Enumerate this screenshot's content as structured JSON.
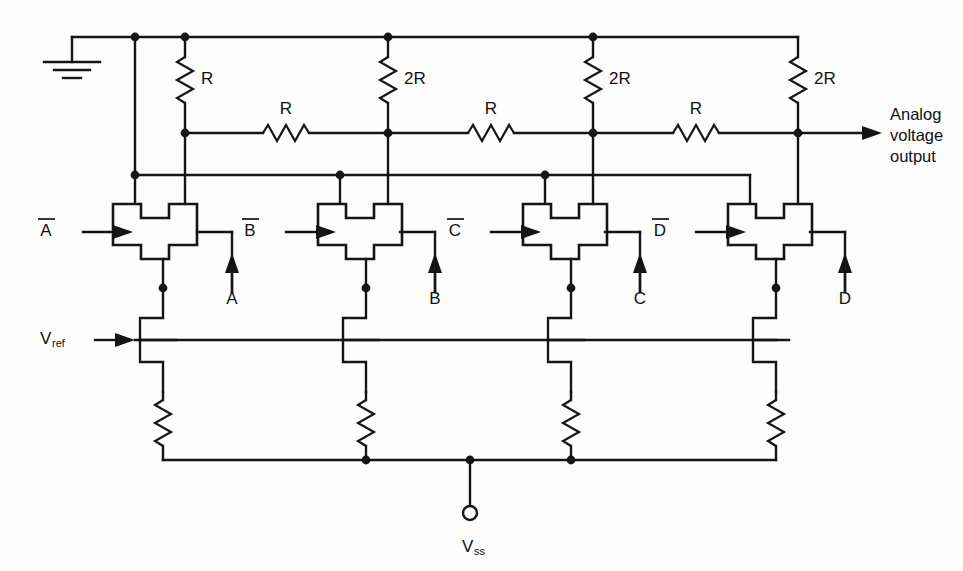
{
  "figure": {
    "type": "circuit-schematic",
    "background_color": "#fdfdfd",
    "line_color": "#151515"
  },
  "labels": {
    "ground": "ground-symbol",
    "output_line1": "Analog",
    "output_line2": "voltage",
    "output_line3": "output",
    "vref": "V",
    "vref_sub": "ref",
    "vss": "V",
    "vss_sub": "ss"
  },
  "resistors": {
    "vertical": [
      {
        "id": "r-vert-1",
        "label": "R",
        "x": 185
      },
      {
        "id": "r-vert-2",
        "label": "2R",
        "x": 388
      },
      {
        "id": "r-vert-3",
        "label": "2R",
        "x": 593
      },
      {
        "id": "r-vert-4",
        "label": "2R",
        "x": 798
      }
    ],
    "series": [
      {
        "id": "r-series-1",
        "label": "R",
        "cx": 286
      },
      {
        "id": "r-series-2",
        "label": "R",
        "cx": 491
      },
      {
        "id": "r-series-3",
        "label": "R",
        "cx": 696
      }
    ],
    "pulldown": [
      {
        "id": "r-pulldown-1",
        "label": ""
      },
      {
        "id": "r-pulldown-2",
        "label": ""
      },
      {
        "id": "r-pulldown-3",
        "label": ""
      },
      {
        "id": "r-pulldown-4",
        "label": ""
      }
    ]
  },
  "stages": [
    {
      "id": "stage-a",
      "inverted_input": "A",
      "true_input": "A",
      "gate_center_x": 163,
      "ladder_x": 185
    },
    {
      "id": "stage-b",
      "inverted_input": "B",
      "true_input": "B",
      "gate_center_x": 368,
      "ladder_x": 388
    },
    {
      "id": "stage-c",
      "inverted_input": "C",
      "true_input": "C",
      "gate_center_x": 573,
      "ladder_x": 593
    },
    {
      "id": "stage-d",
      "inverted_input": "D",
      "true_input": "D",
      "gate_center_x": 778,
      "ladder_x": 798
    }
  ],
  "rails": {
    "top_ground_rail_y": 37,
    "ladder_rail_y": 133,
    "gate_control_rail_y": 175,
    "vref_rail_y": 340,
    "vss_rail_y": 460
  }
}
